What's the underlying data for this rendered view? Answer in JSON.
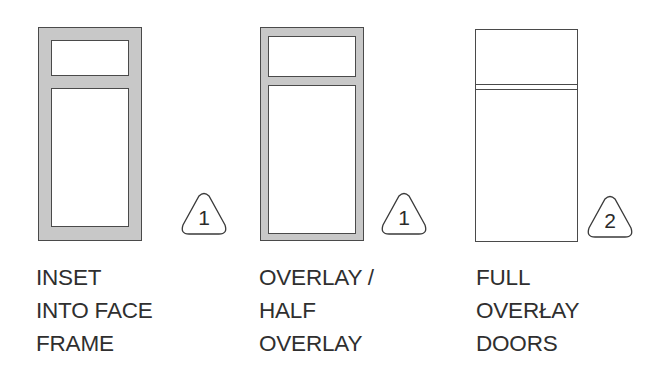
{
  "diagram": {
    "doors": [
      {
        "id": "inset",
        "style": "inset into face frame",
        "tag_number": "1",
        "label_lines": [
          "INSET",
          "INTO FACE",
          "FRAME"
        ]
      },
      {
        "id": "overlay",
        "style": "overlay / half overlay",
        "tag_number": "1",
        "label_lines": [
          "OVERLAY /",
          "HALF",
          "OVERLAY"
        ]
      },
      {
        "id": "full-overlay",
        "style": "full overlay doors",
        "tag_number": "2",
        "label_lines": [
          "FULL",
          "OVERŁAY",
          "DOORS"
        ]
      }
    ],
    "colors": {
      "frame_fill": "#c8c8c8",
      "line": "#4a4a4a",
      "text": "#2f2f2f",
      "background": "#ffffff"
    }
  }
}
